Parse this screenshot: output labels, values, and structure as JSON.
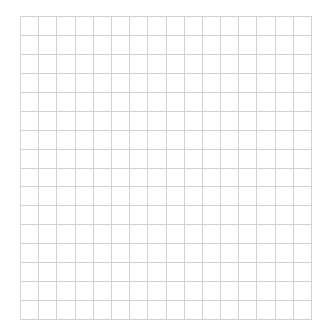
{
  "grid": {
    "rows": 16,
    "columns": 16,
    "line_color": "#d2d2d2",
    "background": "#ffffff"
  }
}
